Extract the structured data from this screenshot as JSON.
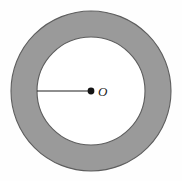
{
  "figure": {
    "name": "annulus-with-radius",
    "canvas": {
      "width": 182,
      "height": 181,
      "background_color": "#FEFEFE"
    },
    "center": {
      "x": 91,
      "y": 91,
      "label": "O",
      "dot_radius": 3.4,
      "dot_color": "#141414"
    },
    "outer_circle": {
      "radius": 80,
      "fill_color": "#9A9A9A",
      "stroke_color": "#5E5E5E",
      "stroke_width": 1.1
    },
    "inner_circle": {
      "radius": 54,
      "fill_color": "#FFFFFF",
      "stroke_color": "#5E5E5E",
      "stroke_width": 1.1
    },
    "ring": {
      "band_width": 26,
      "fill_color": "#9A9A9A"
    },
    "radius_segment": {
      "from_x": 37,
      "from_y": 91,
      "to_x": 89,
      "to_y": 91,
      "length": 52,
      "stroke_color": "#1E1E1E",
      "stroke_width": 1.2
    },
    "label_position": {
      "x": 98,
      "y": 96
    }
  }
}
